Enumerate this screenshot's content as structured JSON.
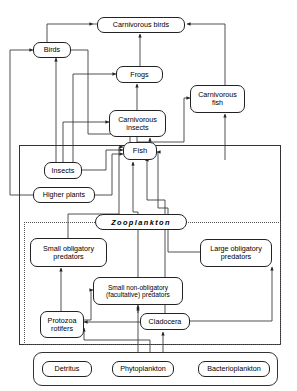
{
  "diagram": {
    "nodes": [
      {
        "id": "carnivorous_birds",
        "label": "Carnivorous birds"
      },
      {
        "id": "birds",
        "label": "Birds"
      },
      {
        "id": "frogs",
        "label": "Frogs"
      },
      {
        "id": "carnivorous_fish",
        "label": "Carnivorous fish"
      },
      {
        "id": "carnivorous_fish_l1",
        "label": "Carnivorous"
      },
      {
        "id": "carnivorous_fish_l2",
        "label": "fish"
      },
      {
        "id": "carnivorous_insects_l1",
        "label": "Carnivorous"
      },
      {
        "id": "carnivorous_insects_l2",
        "label": "insects"
      },
      {
        "id": "fish",
        "label": "Fish"
      },
      {
        "id": "insects",
        "label": "Insects"
      },
      {
        "id": "higher_plants",
        "label": "Higher plants"
      },
      {
        "id": "zooplankton",
        "label": "Zooplankton"
      },
      {
        "id": "small_obligatory_l1",
        "label": "Small obligatory"
      },
      {
        "id": "small_obligatory_l2",
        "label": "predators"
      },
      {
        "id": "large_obligatory_l1",
        "label": "Large obligatory"
      },
      {
        "id": "large_obligatory_l2",
        "label": "predators"
      },
      {
        "id": "small_non_obligatory_l1",
        "label": "Small non-obligatory"
      },
      {
        "id": "small_non_obligatory_l2",
        "label": "(facultative) predators"
      },
      {
        "id": "protozoa_l1",
        "label": "Protozoa"
      },
      {
        "id": "protozoa_l2",
        "label": "rotifers"
      },
      {
        "id": "cladocera",
        "label": "Cladocera"
      },
      {
        "id": "detritus",
        "label": "Detritus"
      },
      {
        "id": "phytoplankton",
        "label": "Phytoplankton"
      },
      {
        "id": "bacterioplankton",
        "label": "Bacterioplankton"
      }
    ],
    "colors": {
      "line": "#333333",
      "box_border": "#222222",
      "background": "#ffffff",
      "dotted_group": "#555555"
    }
  }
}
